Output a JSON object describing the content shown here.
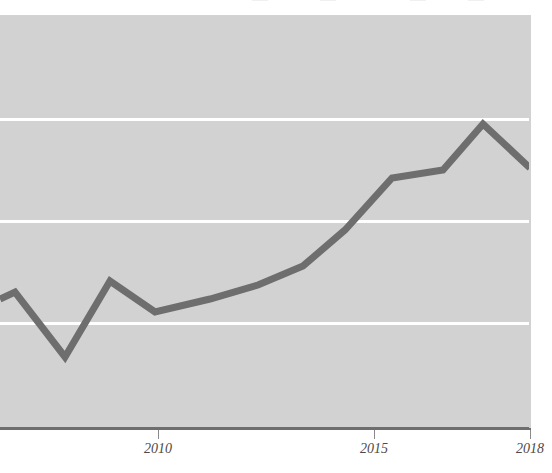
{
  "figure": {
    "background_color": "#ffffff",
    "plot_background_color": "#d2d2d2",
    "gridline_color": "#ffffff",
    "axis_color": "#6e6e6e",
    "series_color": "#6e6e6e"
  },
  "legend": {
    "visible_fragment": true,
    "note": "legend row cropped off at top edge",
    "entries": [
      {
        "label": "",
        "swatch_color": "#f0f0f2",
        "x": 252
      },
      {
        "label": "",
        "swatch_color": "#f0f0f2",
        "x": 320
      },
      {
        "label": "",
        "swatch_color": "#f0f0f2",
        "x": 410
      },
      {
        "label": "",
        "swatch_color": "#f0f0f2",
        "x": 468
      }
    ]
  },
  "axes": {
    "x_tick_labels": [
      "2010",
      "2015",
      "2018"
    ],
    "x_tick_positions": [
      158,
      374,
      530
    ],
    "y_gridline_positions": [
      118,
      220,
      322
    ],
    "x_axis_y": 427
  },
  "chart_data": {
    "type": "line",
    "title": "",
    "subtitle": "",
    "xlabel": "",
    "ylabel": "",
    "grid": true,
    "legend_position": "top",
    "xlim": [
      2006.4,
      2018
    ],
    "ylim": [
      0,
      100
    ],
    "xticks": [
      2010,
      2015,
      2018
    ],
    "categories": [
      2006.7,
      2007.2,
      2008.4,
      2009.5,
      2010.4,
      2011.5,
      2012.5,
      2013.6,
      2014.5,
      2015.5,
      2016.6,
      2017.6,
      2018.0
    ],
    "series": [
      {
        "name": "series-1",
        "color": "#6e6e6e",
        "values": [
          36.2,
          39.4,
          23.3,
          42.4,
          34.9,
          39.1,
          43.5,
          49.4,
          62.7,
          71.5,
          73.4,
          85.5,
          74.8
        ]
      }
    ],
    "pixel_points": [
      [
        0,
        299
      ],
      [
        15,
        292
      ],
      [
        65,
        357
      ],
      [
        110,
        281
      ],
      [
        155,
        312
      ],
      [
        210,
        299
      ],
      [
        258,
        285
      ],
      [
        303,
        266
      ],
      [
        345,
        230
      ],
      [
        392,
        178
      ],
      [
        443,
        170
      ],
      [
        483,
        124
      ],
      [
        530,
        168
      ]
    ]
  }
}
